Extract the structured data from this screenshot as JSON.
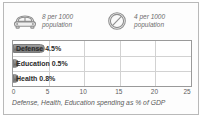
{
  "card": {
    "border_color": "#b9b9b9",
    "background": "#fdfdfd"
  },
  "legend": {
    "items": [
      {
        "icon": "car-icon",
        "text": "8 per 1000\npopulation",
        "value": 8,
        "unit": "per 1000 population"
      },
      {
        "icon": "phone-circle-icon",
        "text": "4 per 1000\npopulation",
        "value": 4,
        "unit": "per 1000 population"
      }
    ]
  },
  "chart_data": {
    "type": "bar",
    "orientation": "horizontal",
    "title": "",
    "caption": "Defense, Health, Education spending as % of GDP",
    "xlabel": "Defense, Health, Education spending as % of GDP",
    "ylabel": "",
    "categories": [
      "Defense",
      "Education",
      "Health"
    ],
    "values": [
      4.5,
      0.5,
      0.8
    ],
    "value_labels": [
      "Defense 4.5%",
      "Education 0.5%",
      "Health 0.8%"
    ],
    "xlim": [
      0,
      25
    ],
    "ticks": [
      "0",
      "5",
      "10",
      "15",
      "20",
      "25"
    ],
    "tick_values": [
      0,
      5,
      10,
      15,
      20,
      25
    ],
    "grid": true,
    "legend_position": "none",
    "bar_color": "#8c8c8c",
    "grid_color": "#d2d2d2",
    "frame_color": "#9a9a9a"
  }
}
